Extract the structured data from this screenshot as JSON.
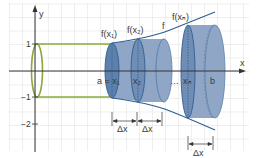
{
  "figure": {
    "type": "solid-of-revolution-cylinder-approximation",
    "axes": {
      "x_label": "x",
      "y_label": "y",
      "y_ticks": [
        "1",
        "−1",
        "−2"
      ]
    },
    "labels": {
      "f_x1": "f(x₁)",
      "f_x2": "f(x₂)",
      "f_xn": "f(xₙ)",
      "f": "f",
      "a_eq_x1": "a = x₁",
      "x2": "x₂",
      "dots": "…",
      "xn": "xₙ",
      "b": "b",
      "delta_x_1": "Δx",
      "delta_x_2": "Δx",
      "delta_x_3": "Δx"
    },
    "colors": {
      "grid": "#d9d9d9",
      "axis": "#333333",
      "green_cylinder": "#8aa83c",
      "disk_fill": "#8fa6c6",
      "disk_face": "#5e80ad",
      "curve": "#2f5f92"
    }
  }
}
